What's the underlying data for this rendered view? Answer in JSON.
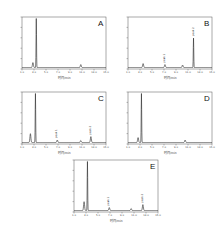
{
  "chart_data": [
    {
      "type": "line",
      "panel": "A",
      "title": "A",
      "xlabel": "时间/min",
      "ylabel": "mV",
      "xticks": [
        "1.0",
        "3.0",
        "5.0",
        "7.0",
        "9.0",
        "11.0",
        "13.0",
        "15.0"
      ],
      "peaks": [
        {
          "x": 0.13,
          "h": 0.1
        },
        {
          "x": 0.17,
          "h": 1.0
        },
        {
          "x": 0.7,
          "h": 0.06
        }
      ],
      "annotations": []
    },
    {
      "type": "line",
      "panel": "B",
      "title": "B",
      "xlabel": "时间/min",
      "ylabel": "mV",
      "xticks": [
        "1.0",
        "3.0",
        "5.0",
        "7.0",
        "9.0",
        "11.0",
        "13.0",
        "15.0"
      ],
      "peaks": [
        {
          "x": 0.18,
          "h": 0.08
        },
        {
          "x": 0.44,
          "h": 0.06
        },
        {
          "x": 0.65,
          "h": 0.05
        },
        {
          "x": 0.78,
          "h": 0.6
        }
      ],
      "annotations": [
        {
          "x": 0.44,
          "text": "peak 1"
        },
        {
          "x": 0.78,
          "text": "peak 2"
        }
      ]
    },
    {
      "type": "line",
      "panel": "C",
      "title": "C",
      "xlabel": "时间/min",
      "ylabel": "mV",
      "xticks": [
        "1.0",
        "3.0",
        "5.0",
        "7.0",
        "9.0",
        "11.0",
        "13.0",
        "15.0"
      ],
      "peaks": [
        {
          "x": 0.1,
          "h": 0.18
        },
        {
          "x": 0.16,
          "h": 1.0
        },
        {
          "x": 0.42,
          "h": 0.05
        },
        {
          "x": 0.7,
          "h": 0.04
        },
        {
          "x": 0.82,
          "h": 0.12
        }
      ],
      "annotations": [
        {
          "x": 0.42,
          "text": "peak 1"
        },
        {
          "x": 0.82,
          "text": "peak 2"
        }
      ]
    },
    {
      "type": "line",
      "panel": "D",
      "title": "D",
      "xlabel": "时间/min",
      "ylabel": "mV",
      "xticks": [
        "1.0",
        "3.0",
        "5.0",
        "7.0",
        "9.0",
        "11.0",
        "13.0",
        "15.0"
      ],
      "peaks": [
        {
          "x": 0.12,
          "h": 0.1
        },
        {
          "x": 0.16,
          "h": 1.0
        },
        {
          "x": 0.68,
          "h": 0.05
        }
      ],
      "annotations": []
    },
    {
      "type": "line",
      "panel": "E",
      "title": "E",
      "xlabel": "时间/min",
      "ylabel": "mV",
      "xticks": [
        "1.0",
        "3.0",
        "5.0",
        "7.0",
        "9.0",
        "11.0",
        "13.0",
        "15.0"
      ],
      "peaks": [
        {
          "x": 0.12,
          "h": 0.18
        },
        {
          "x": 0.16,
          "h": 1.0
        },
        {
          "x": 0.42,
          "h": 0.06
        },
        {
          "x": 0.68,
          "h": 0.04
        },
        {
          "x": 0.82,
          "h": 0.12
        }
      ],
      "annotations": [
        {
          "x": 0.42,
          "text": "peak 1"
        },
        {
          "x": 0.82,
          "text": "peak 2"
        }
      ]
    }
  ],
  "panels": {
    "A": {
      "label": "A",
      "xlabel": "时间/min"
    },
    "B": {
      "label": "B",
      "xlabel": "时间/min"
    },
    "C": {
      "label": "C",
      "xlabel": "时间/min"
    },
    "D": {
      "label": "D",
      "xlabel": "时间/min"
    },
    "E": {
      "label": "E",
      "xlabel": "时间/min"
    }
  }
}
